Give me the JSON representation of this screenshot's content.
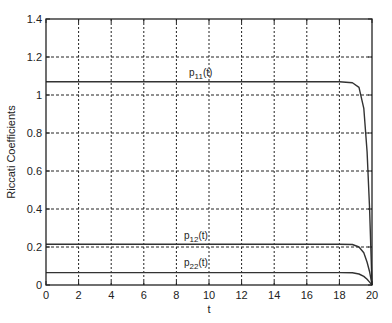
{
  "chart_data": {
    "type": "line",
    "title": "",
    "xlabel": "t",
    "ylabel": "Riccati Coefficients",
    "xlim": [
      0,
      20
    ],
    "ylim": [
      0,
      1.4
    ],
    "grid": true,
    "legend": "none (inline curve labels)",
    "x_ticks": [
      "0",
      "2",
      "4",
      "6",
      "8",
      "10",
      "12",
      "14",
      "16",
      "18",
      "20"
    ],
    "y_ticks": [
      "0",
      "0.2",
      "0.4",
      "0.6",
      "0.8",
      "1",
      "1.2",
      "1.4"
    ],
    "x": [
      0,
      2,
      4,
      6,
      8,
      10,
      12,
      14,
      16,
      18,
      18.8,
      19.2,
      19.5,
      19.7,
      19.85,
      20
    ],
    "series": [
      {
        "name": "p11(t)",
        "values": [
          1.07,
          1.07,
          1.07,
          1.07,
          1.07,
          1.07,
          1.07,
          1.07,
          1.07,
          1.07,
          1.065,
          1.04,
          0.93,
          0.7,
          0.4,
          0.0
        ]
      },
      {
        "name": "p12(t)",
        "values": [
          0.215,
          0.215,
          0.215,
          0.215,
          0.215,
          0.215,
          0.215,
          0.215,
          0.215,
          0.215,
          0.213,
          0.2,
          0.17,
          0.12,
          0.07,
          0.0
        ]
      },
      {
        "name": "p22(t)",
        "values": [
          0.065,
          0.065,
          0.065,
          0.065,
          0.065,
          0.065,
          0.065,
          0.065,
          0.065,
          0.065,
          0.064,
          0.058,
          0.045,
          0.03,
          0.015,
          0.0
        ]
      }
    ],
    "annotations": [
      {
        "text": "p11(t)",
        "x": 8.8,
        "y": 1.1
      },
      {
        "text": "p12(t)",
        "x": 8.5,
        "y": 0.245
      },
      {
        "text": "p22(t)",
        "x": 8.5,
        "y": 0.09
      }
    ]
  },
  "labels": {
    "xlabel": "t",
    "ylabel": "Riccati Coefficients",
    "p11_main": "p",
    "p11_sub": "11",
    "p11_tail": "(t)",
    "p12_main": "p",
    "p12_sub": "12",
    "p12_tail": "(t)",
    "p22_main": "p",
    "p22_sub": "22",
    "p22_tail": "(t)"
  },
  "colors": {
    "curve": "#333333",
    "grid": "#222222",
    "axes": "#222222",
    "background": "#ffffff"
  }
}
